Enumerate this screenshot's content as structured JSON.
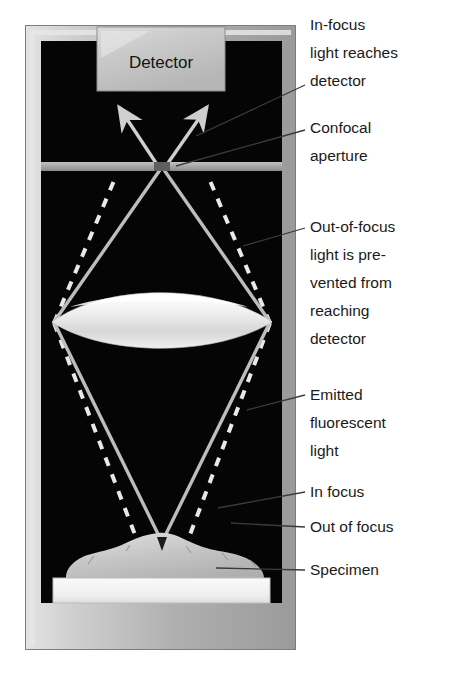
{
  "figure": {
    "background_color": "#ffffff"
  },
  "instrument": {
    "frame": {
      "name": "microscope-housing",
      "outer_color": "#b3b3b3",
      "bevel_light_color": "#e0e0e0",
      "bevel_dark_color": "#8e8e8e",
      "interior_color": "#000000"
    },
    "detector": {
      "label": "Detector",
      "fill_color": "#c9c9c9",
      "text_color": "#141414"
    },
    "aperture": {
      "bar_color": "#a8a8a8",
      "gap_color": "#5a5a5a",
      "pinhole_note": "central gap in bar"
    },
    "lens": {
      "name": "objective-lens",
      "fill_color": "#ededed",
      "shape": "biconvex"
    },
    "slide": {
      "name": "microscope-slide",
      "fill_color": "#f2f2f2"
    },
    "specimen": {
      "name": "specimen-blob",
      "fill_color": "#c4c4c4"
    },
    "rays": {
      "in_focus": {
        "style": "solid",
        "color": "#bdbdbd",
        "description": "In-focus light converges at confocal aperture and reaches detector"
      },
      "out_of_focus": {
        "style": "dashed",
        "color": "#e8e8e8",
        "description": "Out-of-focus light blocked by aperture plate"
      }
    }
  },
  "labels": [
    {
      "id": "in-focus-reaches-detector",
      "lines": [
        "In-focus",
        "light reaches",
        "detector"
      ],
      "x": 310,
      "y": 30
    },
    {
      "id": "confocal-aperture",
      "lines": [
        "Confocal",
        "aperture"
      ],
      "x": 310,
      "y": 123
    },
    {
      "id": "out-of-focus-prevented",
      "lines": [
        "Out-of-focus",
        "light is pre-",
        "vented from",
        "reaching",
        "detector"
      ],
      "x": 310,
      "y": 222
    },
    {
      "id": "emitted-fluorescent-light",
      "lines": [
        "Emitted",
        "fluorescent",
        "light"
      ],
      "x": 310,
      "y": 388
    },
    {
      "id": "in-focus",
      "lines": [
        "In focus"
      ],
      "x": 310,
      "y": 490
    },
    {
      "id": "out-of-focus",
      "lines": [
        "Out of focus"
      ],
      "x": 310,
      "y": 525
    },
    {
      "id": "specimen",
      "lines": [
        "Specimen"
      ],
      "x": 310,
      "y": 565
    }
  ]
}
